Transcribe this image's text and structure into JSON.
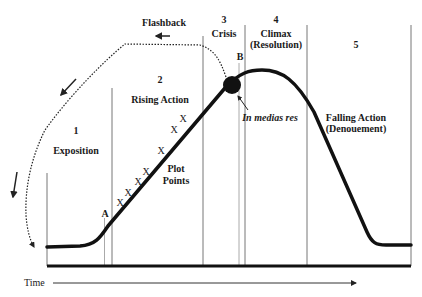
{
  "diagram": {
    "sections": [
      {
        "number": "1",
        "label": "Exposition"
      },
      {
        "number": "2",
        "label": "Rising Action"
      },
      {
        "number": "3",
        "label": "Crisis"
      },
      {
        "number": "4",
        "label": "Climax",
        "sublabel": "(Resolution)"
      },
      {
        "number": "5",
        "label": "Falling Action",
        "sublabel": "(Denouement)"
      }
    ],
    "flashback_label": "Flashback",
    "plot_points_label": [
      "Plot",
      "Points"
    ],
    "plot_point_marker": "X",
    "marker_a": "A",
    "marker_b": "B",
    "in_medias_res_label": "In medias res",
    "time_axis_label": "Time",
    "colors": {
      "line": "#111111",
      "divider": "#666666",
      "background": "#ffffff"
    }
  }
}
